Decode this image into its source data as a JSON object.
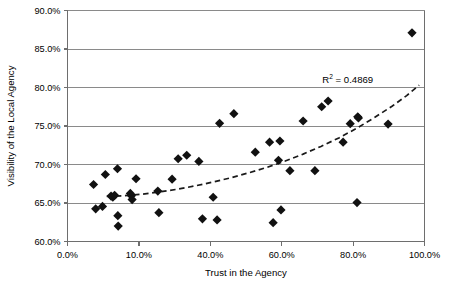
{
  "chart_data": {
    "type": "scatter",
    "title": "",
    "xlabel": "Trust in the Agency",
    "ylabel": "Visibility of the Local Agency",
    "xlim": [
      0,
      100
    ],
    "ylim": [
      60,
      90
    ],
    "xticks": [
      0,
      20,
      40,
      60,
      80,
      100
    ],
    "yticks": [
      60,
      65,
      70,
      75,
      80,
      85,
      90
    ],
    "xtick_labels": [
      "0.0%",
      "10.0%",
      "40.0%",
      "60.0%",
      "80.0%",
      "100.0%"
    ],
    "ytick_labels": [
      "60.0%",
      "65.0%",
      "70.0%",
      "75.0%",
      "80.0%",
      "85.0%",
      "90.0%"
    ],
    "grid": "horizontal",
    "legend": "none",
    "marker": "diamond",
    "marker_color": "#111111",
    "annotations": [
      {
        "name": "r-squared",
        "text": "R2 = 0.4869",
        "prefix": "R",
        "superscript": "2",
        "suffix": " = 0.4869",
        "value": 0.4869,
        "x": 78.5,
        "y": 80.6
      }
    ],
    "trendline": {
      "style": "dashed",
      "type": "polynomial",
      "x_start": 11.0,
      "x_end": 98.5,
      "points": [
        [
          11.0,
          65.85
        ],
        [
          16.0,
          65.95
        ],
        [
          21.0,
          66.15
        ],
        [
          26.0,
          66.45
        ],
        [
          31.0,
          66.8
        ],
        [
          36.0,
          67.25
        ],
        [
          41.0,
          67.75
        ],
        [
          46.0,
          68.3
        ],
        [
          51.0,
          68.95
        ],
        [
          56.0,
          69.65
        ],
        [
          61.0,
          70.45
        ],
        [
          66.0,
          71.35
        ],
        [
          71.0,
          72.35
        ],
        [
          76.0,
          73.45
        ],
        [
          81.0,
          74.7
        ],
        [
          86.0,
          76.1
        ],
        [
          91.0,
          77.6
        ],
        [
          95.0,
          78.95
        ],
        [
          98.5,
          80.3
        ]
      ]
    },
    "points": [
      {
        "x": 7.3,
        "y": 67.4
      },
      {
        "x": 7.9,
        "y": 64.25
      },
      {
        "x": 9.8,
        "y": 64.55
      },
      {
        "x": 10.6,
        "y": 68.7
      },
      {
        "x": 12.2,
        "y": 65.9
      },
      {
        "x": 12.7,
        "y": 65.75
      },
      {
        "x": 13.2,
        "y": 66.0
      },
      {
        "x": 14.0,
        "y": 69.45
      },
      {
        "x": 14.1,
        "y": 63.35
      },
      {
        "x": 14.2,
        "y": 62.0
      },
      {
        "x": 17.6,
        "y": 66.25
      },
      {
        "x": 17.9,
        "y": 65.95
      },
      {
        "x": 18.1,
        "y": 65.45
      },
      {
        "x": 19.2,
        "y": 68.15
      },
      {
        "x": 25.3,
        "y": 66.55
      },
      {
        "x": 25.6,
        "y": 63.75
      },
      {
        "x": 29.3,
        "y": 68.1
      },
      {
        "x": 31.0,
        "y": 70.75
      },
      {
        "x": 33.4,
        "y": 71.2
      },
      {
        "x": 36.8,
        "y": 70.4
      },
      {
        "x": 37.8,
        "y": 62.95
      },
      {
        "x": 40.8,
        "y": 65.75
      },
      {
        "x": 41.9,
        "y": 62.8
      },
      {
        "x": 42.6,
        "y": 75.35
      },
      {
        "x": 46.6,
        "y": 76.6
      },
      {
        "x": 52.6,
        "y": 71.6
      },
      {
        "x": 56.6,
        "y": 72.9
      },
      {
        "x": 57.6,
        "y": 62.45
      },
      {
        "x": 59.1,
        "y": 70.55
      },
      {
        "x": 59.5,
        "y": 73.05
      },
      {
        "x": 59.8,
        "y": 64.1
      },
      {
        "x": 62.3,
        "y": 69.2
      },
      {
        "x": 66.0,
        "y": 75.65
      },
      {
        "x": 69.3,
        "y": 69.2
      },
      {
        "x": 71.2,
        "y": 77.5
      },
      {
        "x": 73.0,
        "y": 78.25
      },
      {
        "x": 77.2,
        "y": 72.9
      },
      {
        "x": 79.2,
        "y": 75.3
      },
      {
        "x": 81.1,
        "y": 65.05
      },
      {
        "x": 81.3,
        "y": 76.2
      },
      {
        "x": 81.5,
        "y": 76.05
      },
      {
        "x": 89.8,
        "y": 75.25
      },
      {
        "x": 96.5,
        "y": 87.1
      }
    ]
  }
}
